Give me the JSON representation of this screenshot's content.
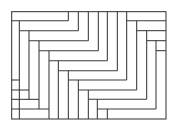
{
  "diagram": {
    "type": "tiling",
    "stroke_color": "#3a3a3a",
    "background": "#ffffff",
    "viewbox": "0 0 519 363",
    "border": {
      "x": 35,
      "y": 35,
      "w": 463,
      "h": 322
    },
    "lines": [
      [
        35,
        62,
        205,
        62
      ],
      [
        205,
        35,
        205,
        62
      ],
      [
        235,
        35,
        235,
        92
      ],
      [
        58,
        62,
        58,
        357
      ],
      [
        58,
        92,
        235,
        92
      ],
      [
        87,
        92,
        87,
        298
      ],
      [
        87,
        122,
        265,
        122
      ],
      [
        265,
        35,
        265,
        122
      ],
      [
        117,
        122,
        117,
        327
      ],
      [
        117,
        152,
        295,
        152
      ],
      [
        295,
        35,
        295,
        152
      ],
      [
        147,
        152,
        147,
        357
      ],
      [
        147,
        182,
        322,
        182
      ],
      [
        322,
        35,
        322,
        182
      ],
      [
        175,
        182,
        175,
        357
      ],
      [
        175,
        212,
        352,
        212
      ],
      [
        352,
        35,
        352,
        212
      ],
      [
        205,
        212,
        205,
        357
      ],
      [
        205,
        240,
        380,
        240
      ],
      [
        380,
        35,
        380,
        240
      ],
      [
        235,
        240,
        235,
        357
      ],
      [
        235,
        270,
        410,
        270
      ],
      [
        410,
        62,
        410,
        270
      ],
      [
        265,
        270,
        265,
        357
      ],
      [
        265,
        298,
        440,
        298
      ],
      [
        440,
        92,
        440,
        298
      ],
      [
        292,
        298,
        292,
        357
      ],
      [
        292,
        327,
        468,
        327
      ],
      [
        468,
        122,
        468,
        327
      ],
      [
        322,
        327,
        322,
        357
      ],
      [
        498,
        357,
        498,
        357
      ],
      [
        380,
        62,
        498,
        62
      ],
      [
        410,
        92,
        498,
        92
      ],
      [
        440,
        122,
        498,
        122
      ],
      [
        468,
        152,
        498,
        152
      ],
      [
        35,
        240,
        58,
        240
      ],
      [
        35,
        270,
        87,
        270
      ],
      [
        35,
        298,
        117,
        298
      ],
      [
        35,
        327,
        147,
        327
      ],
      [
        58,
        240,
        58,
        240
      ]
    ]
  }
}
